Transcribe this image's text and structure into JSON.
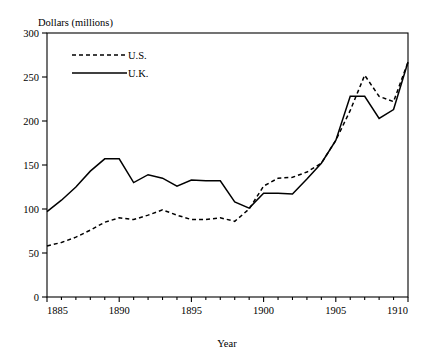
{
  "chart_data": {
    "type": "line",
    "title": "",
    "ylabel": "Dollars (millions)",
    "xlabel": "Year",
    "xlim": [
      1885,
      1910
    ],
    "ylim": [
      0,
      300
    ],
    "xticks": [
      1885,
      1890,
      1895,
      1900,
      1905,
      1910
    ],
    "yticks": [
      0,
      50,
      100,
      150,
      200,
      250,
      300
    ],
    "grid": false,
    "legend_position": "top-left",
    "x": [
      1885,
      1886,
      1887,
      1888,
      1889,
      1890,
      1891,
      1892,
      1893,
      1894,
      1895,
      1896,
      1897,
      1898,
      1899,
      1900,
      1901,
      1902,
      1903,
      1904,
      1905,
      1906,
      1907,
      1908,
      1909,
      1910
    ],
    "series": [
      {
        "name": "U.S.",
        "style": "dashed",
        "color": "#000000",
        "values": [
          58,
          62,
          68,
          76,
          85,
          90,
          88,
          93,
          99,
          93,
          88,
          88,
          90,
          86,
          100,
          126,
          135,
          136,
          142,
          152,
          178,
          212,
          252,
          228,
          222,
          267
        ]
      },
      {
        "name": "U.K.",
        "style": "solid",
        "color": "#000000",
        "values": [
          97,
          110,
          125,
          143,
          157,
          157,
          130,
          139,
          135,
          126,
          133,
          132,
          132,
          108,
          101,
          118,
          118,
          117,
          134,
          152,
          178,
          228,
          228,
          203,
          213,
          267
        ]
      }
    ],
    "legend": [
      {
        "label": "U.S.",
        "style": "dashed"
      },
      {
        "label": "U.K.",
        "style": "solid"
      }
    ]
  },
  "axes": {
    "y_axis_title": "Dollars (millions)",
    "x_axis_title": "Year",
    "y_tick_labels": [
      "300",
      "250",
      "200",
      "150",
      "100",
      "50",
      "0"
    ],
    "x_tick_labels": [
      "1885",
      "1890",
      "1895",
      "1900",
      "1905",
      "1910"
    ]
  }
}
